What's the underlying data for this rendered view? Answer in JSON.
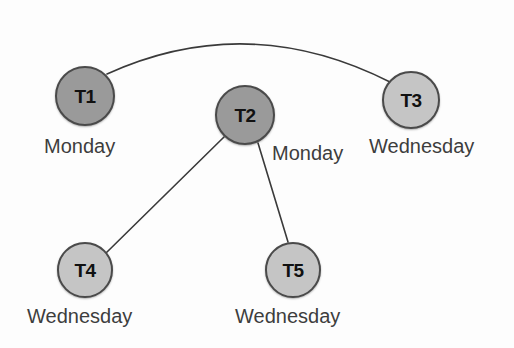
{
  "diagram": {
    "background_color": "#fdfdfd",
    "node_border_color": "#4a4a4a",
    "edge_color": "#3a3a3a",
    "label_color": "#3d3d3d",
    "fill_monday": "#9a9a9a",
    "fill_wednesday": "#c5c5c5",
    "nodes": [
      {
        "id": "T1",
        "day": "Monday",
        "cx": 85,
        "cy": 96,
        "r": 30,
        "fill": "#9a9a9a",
        "id_font_size": 19,
        "label_font_size": 20,
        "label_x": 44,
        "label_y": 136
      },
      {
        "id": "T2",
        "day": "Monday",
        "cx": 245,
        "cy": 115,
        "r": 30,
        "fill": "#9a9a9a",
        "id_font_size": 19,
        "label_font_size": 20,
        "label_x": 272,
        "label_y": 143
      },
      {
        "id": "T3",
        "day": "Wednesday",
        "cx": 411,
        "cy": 100,
        "r": 29,
        "fill": "#c5c5c5",
        "id_font_size": 19,
        "label_font_size": 20,
        "label_x": 369,
        "label_y": 136
      },
      {
        "id": "T4",
        "day": "Wednesday",
        "cx": 85,
        "cy": 270,
        "r": 28,
        "fill": "#c5c5c5",
        "id_font_size": 19,
        "label_font_size": 20,
        "label_x": 27,
        "label_y": 306
      },
      {
        "id": "T5",
        "day": "Wednesday",
        "cx": 293,
        "cy": 270,
        "r": 28,
        "fill": "#c5c5c5",
        "id_font_size": 19,
        "label_font_size": 20,
        "label_x": 235,
        "label_y": 306
      }
    ],
    "edges": [
      {
        "from": "T1",
        "to": "T3",
        "shape": "curved",
        "path": "M 107 74 Q 248 10 390 82",
        "stroke_width": 1.6
      },
      {
        "from": "T2",
        "to": "T4",
        "shape": "straight",
        "path": "M 224 137 L 106 253",
        "stroke_width": 1.6
      },
      {
        "from": "T2",
        "to": "T5",
        "shape": "straight",
        "path": "M 258 143 L 288 242",
        "stroke_width": 1.6
      }
    ]
  }
}
